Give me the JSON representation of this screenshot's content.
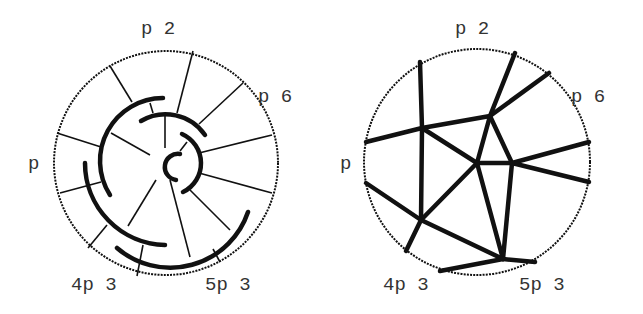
{
  "figure": {
    "left_panel": {
      "description": "Circular arc diagram with chords and nested arcs",
      "circle": {
        "cx": 166,
        "cy": 163,
        "r": 112
      },
      "labels": [
        {
          "text": "p 2",
          "x": 141,
          "y": 20
        },
        {
          "text": "p 6",
          "x": 258,
          "y": 88
        },
        {
          "text": "p",
          "x": 28,
          "y": 155
        },
        {
          "text": "4p 3",
          "x": 71,
          "y": 276
        },
        {
          "text": "5p 3",
          "x": 205,
          "y": 276
        }
      ]
    },
    "right_panel": {
      "description": "Planar graph (dual) inside circle",
      "circle": {
        "cx": 477,
        "cy": 162,
        "r": 113
      },
      "labels": [
        {
          "text": "p 2",
          "x": 455,
          "y": 20
        },
        {
          "text": "p 6",
          "x": 571,
          "y": 88
        },
        {
          "text": "p",
          "x": 340,
          "y": 155
        },
        {
          "text": "4p 3",
          "x": 383,
          "y": 276
        },
        {
          "text": "5p 3",
          "x": 519,
          "y": 276
        }
      ]
    },
    "stroke_color": "#111111",
    "label_color": "#333333"
  }
}
